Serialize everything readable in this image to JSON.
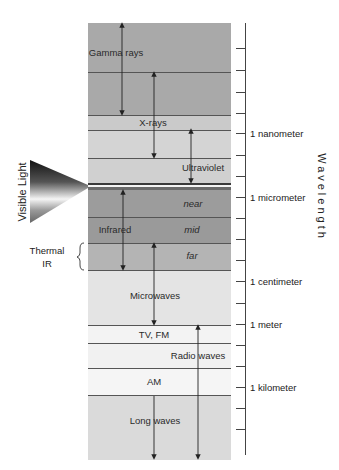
{
  "diagram": {
    "title_axis": "Wavelength",
    "side_label": "Visible Light",
    "thermal_label_line1": "Thermal",
    "thermal_label_line2": "IR",
    "bands": [
      {
        "id": "gamma",
        "label": "Gamma rays",
        "color": "#a9a9a9"
      },
      {
        "id": "xray",
        "label": "X-rays",
        "color": "#c9c9c9"
      },
      {
        "id": "ultraviolet",
        "label": "Ultraviolet",
        "color": "#d2d2d2"
      },
      {
        "id": "infrared",
        "label": "Infrared",
        "color": "#9b9b9b"
      },
      {
        "id": "ir_near",
        "label": "near",
        "color": "#9b9b9b"
      },
      {
        "id": "ir_mid",
        "label": "mid",
        "color": "#9b9b9b"
      },
      {
        "id": "ir_far",
        "label": "far",
        "color": "#b3b3b3"
      },
      {
        "id": "microwaves",
        "label": "Microwaves",
        "color": "#e3e3e3"
      },
      {
        "id": "tv_fm",
        "label": "TV, FM",
        "color": "#f2f2f2"
      },
      {
        "id": "radio",
        "label": "Radio waves",
        "color": "#f2f2f2"
      },
      {
        "id": "am",
        "label": "AM",
        "color": "#f4f4f4"
      },
      {
        "id": "long_waves",
        "label": "Long waves",
        "color": "#dadada"
      }
    ],
    "scale": [
      {
        "label": "1 nanometer"
      },
      {
        "label": "1 micrometer"
      },
      {
        "label": "1 centimeter"
      },
      {
        "label": "1 meter"
      },
      {
        "label": "1 kilometer"
      }
    ]
  }
}
